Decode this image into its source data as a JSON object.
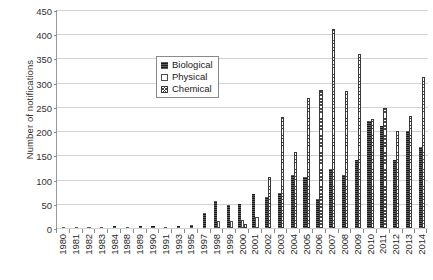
{
  "chart_data": {
    "type": "bar",
    "title": "",
    "xlabel": "",
    "ylabel": "Number of notifications",
    "ylim": [
      0,
      450
    ],
    "ytick_step": 50,
    "yticks": [
      0,
      50,
      100,
      150,
      200,
      250,
      300,
      350,
      400,
      450
    ],
    "grid": true,
    "legend_position": "upper-left-inside",
    "categories": [
      "1980",
      "1981",
      "1982",
      "1983",
      "1984",
      "1988",
      "1989",
      "1990",
      "1991",
      "1993",
      "1995",
      "1997",
      "1998",
      "1999",
      "2000",
      "2001",
      "2002",
      "2003",
      "2004",
      "2005",
      "2006",
      "2007",
      "2008",
      "2009",
      "2010",
      "2011",
      "2012",
      "2013",
      "2014"
    ],
    "series": [
      {
        "name": "Biological",
        "color": "#1a1a1a",
        "pattern": "solid-black",
        "values": [
          2,
          3,
          2,
          3,
          4,
          3,
          4,
          5,
          3,
          5,
          6,
          30,
          55,
          48,
          50,
          70,
          63,
          73,
          110,
          105,
          60,
          122,
          110,
          140,
          220,
          210,
          140,
          200,
          168
        ]
      },
      {
        "name": "Physical",
        "color": "#ffffff",
        "pattern": "open-white",
        "values": [
          0,
          0,
          0,
          0,
          0,
          0,
          0,
          0,
          0,
          0,
          0,
          0,
          15,
          14,
          16,
          22,
          0,
          0,
          0,
          0,
          0,
          0,
          0,
          0,
          0,
          0,
          0,
          0,
          0
        ]
      },
      {
        "name": "Chemical",
        "color": "#ffffff",
        "pattern": "crosshatch",
        "values": [
          0,
          0,
          0,
          0,
          0,
          0,
          0,
          0,
          0,
          0,
          0,
          0,
          0,
          0,
          8,
          0,
          105,
          230,
          156,
          268,
          285,
          410,
          283,
          360,
          225,
          248,
          200,
          232,
          312
        ]
      }
    ]
  },
  "legend": {
    "items": [
      {
        "label": "Biological",
        "swatch": "solid-black-swatch"
      },
      {
        "label": "Physical",
        "swatch": "open-white-swatch"
      },
      {
        "label": "Chemical",
        "swatch": "crosshatch-swatch"
      }
    ]
  }
}
